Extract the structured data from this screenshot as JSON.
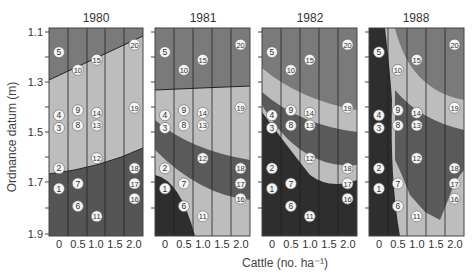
{
  "chart_data": {
    "type": "heatmap",
    "title": "",
    "xlabel": "Cattle (no. ha⁻¹)",
    "ylabel": "Ordnance datum (m)",
    "x_ticks": [
      "0",
      "0.5",
      "1.0",
      "1.5",
      "2.0"
    ],
    "y_ticks": [
      "1.1",
      "1.3",
      "1.5",
      "1.7",
      "1.9"
    ],
    "ylim": [
      1.1,
      1.9
    ],
    "grid": "vertical lines at column boundaries",
    "shading_levels": {
      "light": "#bdbdbd",
      "medium_light": "#a8a8a8",
      "medium": "#7d7d7d",
      "dark": "#555555",
      "darkest": "#2e2e2e"
    },
    "sites": [
      {
        "id": "1",
        "x": 0,
        "y": 1.72
      },
      {
        "id": "2",
        "x": 0,
        "y": 1.64
      },
      {
        "id": "3",
        "x": 0,
        "y": 1.48
      },
      {
        "id": "4",
        "x": 0,
        "y": 1.43
      },
      {
        "id": "5",
        "x": 0,
        "y": 1.18
      },
      {
        "id": "6",
        "x": 0.5,
        "y": 1.79
      },
      {
        "id": "7",
        "x": 0.5,
        "y": 1.7
      },
      {
        "id": "8",
        "x": 0.5,
        "y": 1.47
      },
      {
        "id": "9",
        "x": 0.5,
        "y": 1.41
      },
      {
        "id": "10",
        "x": 0.5,
        "y": 1.25
      },
      {
        "id": "11",
        "x": 1.0,
        "y": 1.83
      },
      {
        "id": "12",
        "x": 1.0,
        "y": 1.6
      },
      {
        "id": "13",
        "x": 1.0,
        "y": 1.47
      },
      {
        "id": "14",
        "x": 1.0,
        "y": 1.42
      },
      {
        "id": "15",
        "x": 1.0,
        "y": 1.21
      },
      {
        "id": "16",
        "x": 2.0,
        "y": 1.76
      },
      {
        "id": "17",
        "x": 2.0,
        "y": 1.7
      },
      {
        "id": "18",
        "x": 2.0,
        "y": 1.64
      },
      {
        "id": "19",
        "x": 2.0,
        "y": 1.4
      },
      {
        "id": "20",
        "x": 2.0,
        "y": 1.15
      }
    ],
    "panels": [
      {
        "title": "1980",
        "description": "Upper dark band above line from 1.30 (x=0) to 1.12 (x=2.0); light middle band; lower dark band below curve from 1.67 (x=0) to 1.57 (x=2.0)"
      },
      {
        "title": "1981",
        "description": "Top dark band above ~1.24; light band; dark wedge in lower-left descending; medium-dark diagonal band; darkest region in lower-left corner"
      },
      {
        "title": "1982",
        "description": "Multiple diagonal bands descending from upper-left to lower-right; darkest zone covering lower half"
      },
      {
        "title": "1988",
        "description": "Narrow dark strip at x=0; light bowl-shaped zone around 10/15; large dark zone in center; light zone lower-right"
      }
    ]
  }
}
